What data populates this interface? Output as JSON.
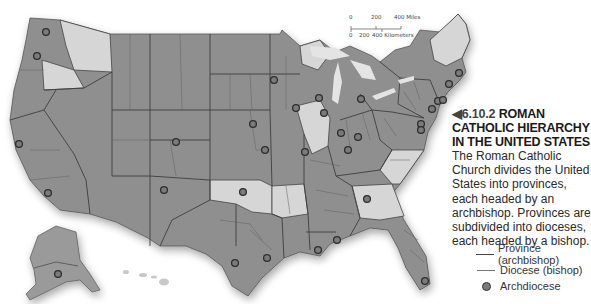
{
  "scale_bar": {
    "miles_ticks": [
      "0",
      "200",
      "400 Miles"
    ],
    "km_ticks": [
      "0",
      "200",
      "400 Kilometers"
    ]
  },
  "caption": {
    "marker": "◀",
    "figure_number": "6.10.2",
    "title": "ROMAN CATHOLIC HIERARCHY IN THE UNITED STATES",
    "body": "The Roman Catholic Church divides the United States into provinces, each headed by an archbishop. Provinces are subdivided into dioceses, each headed by a bishop."
  },
  "legend": {
    "items": [
      {
        "symbol": "solid-dark-line",
        "label": "Province (archbishop)"
      },
      {
        "symbol": "thin-line",
        "label": "Diocese (bishop)"
      },
      {
        "symbol": "dark-circle",
        "label": "Archdiocese"
      }
    ]
  },
  "colors": {
    "province_dark": "#8f8f8f",
    "province_light": "#d6d6d6",
    "border": "#444444",
    "archdiocese_dot": "#7b7b7b",
    "background": "#ffffff"
  },
  "archdioceses": [
    {
      "name": "Seattle",
      "x": 46,
      "y": 32
    },
    {
      "name": "Portland",
      "x": 37,
      "y": 56
    },
    {
      "name": "San Francisco",
      "x": 19,
      "y": 144
    },
    {
      "name": "Los Angeles",
      "x": 48,
      "y": 193
    },
    {
      "name": "Anchorage",
      "x": 58,
      "y": 274
    },
    {
      "name": "Denver",
      "x": 176,
      "y": 142
    },
    {
      "name": "Santa Fe",
      "x": 164,
      "y": 190
    },
    {
      "name": "Omaha",
      "x": 253,
      "y": 124
    },
    {
      "name": "Kansas City",
      "x": 265,
      "y": 150
    },
    {
      "name": "Oklahoma City",
      "x": 243,
      "y": 192
    },
    {
      "name": "St. Paul",
      "x": 274,
      "y": 80
    },
    {
      "name": "Dubuque",
      "x": 296,
      "y": 108
    },
    {
      "name": "Milwaukee",
      "x": 319,
      "y": 98
    },
    {
      "name": "Chicago",
      "x": 324,
      "y": 113
    },
    {
      "name": "St. Louis",
      "x": 305,
      "y": 152
    },
    {
      "name": "San Antonio",
      "x": 235,
      "y": 263
    },
    {
      "name": "Galveston-Houston",
      "x": 267,
      "y": 258
    },
    {
      "name": "New Orleans",
      "x": 318,
      "y": 250
    },
    {
      "name": "Mobile",
      "x": 337,
      "y": 240
    },
    {
      "name": "Atlanta",
      "x": 367,
      "y": 199
    },
    {
      "name": "Miami",
      "x": 425,
      "y": 281
    },
    {
      "name": "Detroit",
      "x": 361,
      "y": 99
    },
    {
      "name": "Indianapolis",
      "x": 341,
      "y": 133
    },
    {
      "name": "Cincinnati",
      "x": 358,
      "y": 137
    },
    {
      "name": "Louisville",
      "x": 348,
      "y": 150
    },
    {
      "name": "Philadelphia",
      "x": 432,
      "y": 109
    },
    {
      "name": "Newark",
      "x": 438,
      "y": 101
    },
    {
      "name": "New York",
      "x": 443,
      "y": 100
    },
    {
      "name": "Hartford",
      "x": 449,
      "y": 84
    },
    {
      "name": "Boston",
      "x": 459,
      "y": 73
    },
    {
      "name": "Baltimore",
      "x": 421,
      "y": 124
    },
    {
      "name": "Washington",
      "x": 421,
      "y": 130
    }
  ]
}
